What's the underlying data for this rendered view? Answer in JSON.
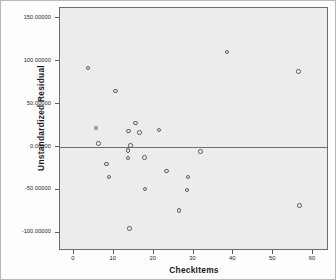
{
  "chart_data": {
    "type": "scatter",
    "title": "",
    "xlabel": "CheckItems",
    "ylabel": "Unstandardized Residual",
    "xlim": [
      -3.5,
      64
    ],
    "ylim": [
      -121,
      162
    ],
    "grid": false,
    "legend": null,
    "xtick_labels": [
      "0",
      "10",
      "20",
      "30",
      "40",
      "50",
      "60"
    ],
    "xticks": [
      0,
      10,
      20,
      30,
      40,
      50,
      60
    ],
    "ytick_labels": [
      "150.00000",
      "100.00000",
      "50.00000",
      "0.00000",
      "-50.00000",
      "-100.00000"
    ],
    "yticks": [
      150,
      100,
      50,
      0,
      -50,
      -100
    ],
    "reference_line_y": 0,
    "marker_style": "open-circle",
    "points": [
      {
        "x": 3.6,
        "y": 92
      },
      {
        "x": 5.6,
        "y": 22
      },
      {
        "x": 6.2,
        "y": 4
      },
      {
        "x": 8.2,
        "y": -20
      },
      {
        "x": 8.8,
        "y": -35
      },
      {
        "x": 10.4,
        "y": 65
      },
      {
        "x": 13.5,
        "y": -4
      },
      {
        "x": 13.6,
        "y": -13
      },
      {
        "x": 13.7,
        "y": 19
      },
      {
        "x": 13.9,
        "y": -95
      },
      {
        "x": 14.2,
        "y": 2
      },
      {
        "x": 15.4,
        "y": 28
      },
      {
        "x": 16.4,
        "y": 17
      },
      {
        "x": 17.7,
        "y": -12
      },
      {
        "x": 17.9,
        "y": -49
      },
      {
        "x": 21.3,
        "y": 20
      },
      {
        "x": 23.2,
        "y": -28
      },
      {
        "x": 26.3,
        "y": -74
      },
      {
        "x": 28.3,
        "y": -50
      },
      {
        "x": 28.6,
        "y": -35
      },
      {
        "x": 31.8,
        "y": -5
      },
      {
        "x": 38.4,
        "y": 111
      },
      {
        "x": 56.3,
        "y": 88
      },
      {
        "x": 56.6,
        "y": -68
      }
    ],
    "axis": {
      "plot_bg_color": "#ececec",
      "frame_color": "#6e6e6e",
      "marker_color": "#5d5d5d",
      "reference_line_color": "#6f6f6f",
      "figure_bg_color": "#fdfdfd"
    }
  }
}
